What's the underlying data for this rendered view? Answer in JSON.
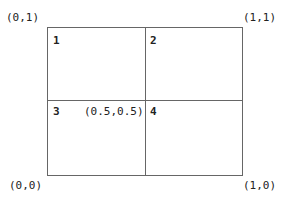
{
  "corners": {
    "top_left": "(0,1)",
    "top_right": "(1,1)",
    "bottom_left": "(0,0)",
    "bottom_right": "(1,0)",
    "center": "(0.5,0.5)"
  },
  "quadrants": [
    "1",
    "2",
    "3",
    "4"
  ],
  "colors": {
    "line": "#666666",
    "text": "#222222"
  }
}
